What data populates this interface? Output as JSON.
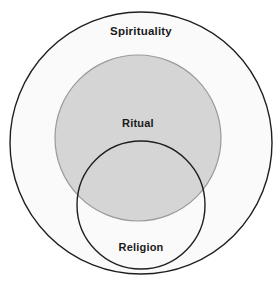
{
  "diagram": {
    "type": "venn",
    "title": "",
    "canvas": {
      "width": 280,
      "height": 292,
      "background": "#ffffff"
    },
    "sets": [
      {
        "id": "spirituality",
        "label": "Spirituality",
        "shape": "circle",
        "center_x": 141,
        "center_y": 143,
        "radius": 131,
        "fill": "#fafafa",
        "stroke": "#1f1f1f",
        "stroke_width": 1.4,
        "label_x": 141,
        "label_y": 32,
        "label_color": "#1a1a1a",
        "contains": [
          "ritual",
          "religion"
        ]
      },
      {
        "id": "ritual",
        "label": "Ritual",
        "shape": "circle",
        "center_x": 138,
        "center_y": 138,
        "radius": 83,
        "fill": "#d5d5d5",
        "stroke": "#9a9a9a",
        "stroke_width": 1.2,
        "label_x": 138,
        "label_y": 124,
        "label_color": "#1a1a1a",
        "contains": []
      },
      {
        "id": "religion",
        "label": "Religion",
        "shape": "circle",
        "center_x": 141,
        "center_y": 205,
        "radius": 64,
        "fill": "none",
        "stroke": "#1f1f1f",
        "stroke_width": 1.4,
        "label_x": 141,
        "label_y": 248,
        "label_color": "#1a1a1a",
        "contains": []
      }
    ],
    "relationships": [
      {
        "from": "ritual",
        "to": "spirituality",
        "kind": "subset"
      },
      {
        "from": "religion",
        "to": "spirituality",
        "kind": "subset"
      },
      {
        "from": "ritual",
        "to": "religion",
        "kind": "partial-overlap"
      }
    ],
    "colors": {
      "page_background": "#ffffff",
      "outer_fill": "#fafafa",
      "ritual_fill": "#d5d5d5",
      "religion_fill": "#ffffff",
      "dark_stroke": "#1f1f1f",
      "gray_stroke": "#9a9a9a",
      "label_text": "#1a1a1a"
    }
  }
}
